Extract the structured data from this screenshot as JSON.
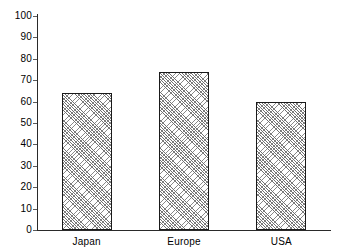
{
  "chart_data": {
    "type": "bar",
    "title": "",
    "subtitle": "",
    "xlabel": "",
    "ylabel": "",
    "categories": [
      "Japan",
      "Europe",
      "USA"
    ],
    "values": [
      64,
      74,
      60
    ],
    "series": [
      {
        "name": "",
        "values": [
          64,
          74,
          60
        ]
      }
    ],
    "ylim": [
      0,
      100
    ],
    "y_ticks": [
      0,
      10,
      20,
      30,
      40,
      50,
      60,
      70,
      80,
      90,
      100
    ],
    "y_tick_labels": [
      "0",
      "10",
      "20",
      "30",
      "40",
      "50",
      "60",
      "70",
      "80",
      "90",
      "100"
    ],
    "grid": false,
    "legend": false,
    "legend_position": "none",
    "bar_fill": "diagonal-hatch",
    "bar_edge_color": "#1a1a1a",
    "bar_hatch_color": "#707070",
    "axis_color": "#2a2a2a",
    "background_color": "#ffffff",
    "annotations": []
  }
}
